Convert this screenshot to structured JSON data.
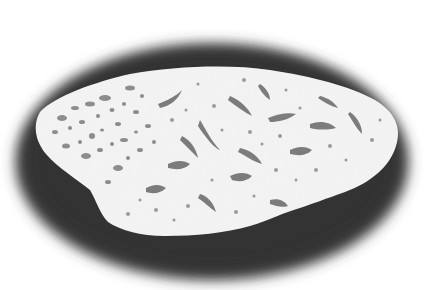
{
  "image": {
    "description": "Grayscale photograph of a white porous irregular specimen (bone/coral-like fragment) resting on a dark soft-edged oval shadow over a white background",
    "colors": {
      "background": "#ffffff",
      "shadow": "#3a3a3a",
      "shadow_edge": "#8a8a8a",
      "specimen": "#f4f4f4",
      "pores": "#8c8c8c",
      "pores_dark": "#6a6a6a"
    }
  }
}
